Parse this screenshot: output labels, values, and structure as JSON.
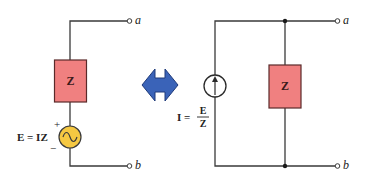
{
  "diagram": {
    "colors": {
      "wire": "#3a3a3a",
      "impedance_fill": "#f08080",
      "impedance_stroke": "#5a2a2a",
      "ac_source_fill": "#f5c842",
      "arrow_fill": "#3a63b8",
      "arrow_stroke": "#1e3a7a",
      "text": "#222222"
    },
    "left_circuit": {
      "impedance_label": "Z",
      "source_label": "E = IZ",
      "plus": "+",
      "minus": "−",
      "terminal_top": "a",
      "terminal_bottom": "b"
    },
    "conversion_arrow": "double-headed-arrow",
    "right_circuit": {
      "impedance_label": "Z",
      "current_label_lhs": "I =",
      "current_fraction_num": "E",
      "current_fraction_den": "Z",
      "terminal_top": "a",
      "terminal_bottom": "b"
    }
  }
}
